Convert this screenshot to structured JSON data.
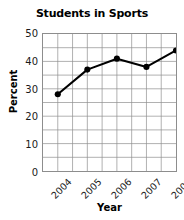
{
  "chart_data": {
    "type": "line",
    "title": "Students in Sports",
    "xlabel": "Year",
    "ylabel": "Percent",
    "categories": [
      "2004",
      "2005",
      "2006",
      "2007",
      "2008"
    ],
    "values": [
      28,
      37,
      41,
      38,
      44
    ],
    "series": [
      {
        "name": "Percent",
        "values": [
          28,
          37,
          41,
          38,
          44
        ]
      }
    ],
    "ylim": [
      0,
      50
    ],
    "yticks": [
      0,
      10,
      20,
      30,
      40,
      50
    ],
    "ytick_labels": [
      "0",
      "10",
      "20",
      "30",
      "40",
      "50"
    ],
    "y_minor_step": 5,
    "xtick_labels": [
      "2004",
      "2005",
      "2006",
      "2007",
      "2008"
    ],
    "xtick_rotation": -45,
    "grid": true,
    "grid_color": "#8d8d8d",
    "legend": false,
    "line_color": "#000000",
    "marker": "circle",
    "marker_color": "#000000"
  }
}
